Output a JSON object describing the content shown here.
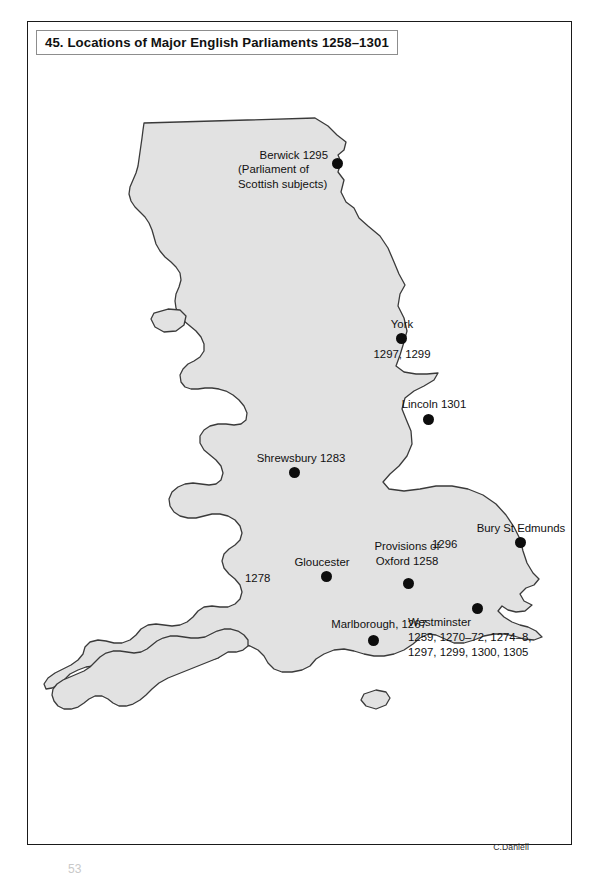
{
  "page": {
    "title_number": "45.",
    "title": "45. Locations of Major English Parliaments 1258–1301",
    "credit": "C.Daniell",
    "folio": "53",
    "background_color": "#ffffff",
    "frame_color": "#1a1a1a",
    "title_box_border_color": "#8d8d8d"
  },
  "map": {
    "name": "england-and-wales-outline",
    "fill_color": "#e2e2e2",
    "stroke_color": "#3a3a3a",
    "marker_color": "#0d0d0d",
    "label_color": "#111111"
  },
  "markers": [
    {
      "id": "berwick",
      "name": "Berwick",
      "lines": [
        "Berwick 1295",
        "(Parliament of",
        "Scottish subjects)"
      ],
      "years": "1295",
      "note": "Parliament of Scottish subjects",
      "dot": {
        "x": 309,
        "y": 141
      },
      "label": {
        "x": 236,
        "y": 134,
        "align": "left"
      }
    },
    {
      "id": "york",
      "name": "York",
      "lines": [
        "York",
        "1297, 1299"
      ],
      "years": "1297, 1299",
      "dot": {
        "x": 379,
        "y": 321
      },
      "label_above": {
        "x": 379,
        "y": 302
      },
      "label_below": {
        "x": 379,
        "y": 330
      }
    },
    {
      "id": "lincoln",
      "name": "Lincoln",
      "lines": [
        "Lincoln 1301"
      ],
      "years": "1301",
      "dot": {
        "x": 406,
        "y": 402
      },
      "label": {
        "x": 406,
        "y": 382
      }
    },
    {
      "id": "shrewsbury",
      "name": "Shrewsbury",
      "lines": [
        "Shrewsbury 1283"
      ],
      "years": "1283",
      "dot": {
        "x": 272,
        "y": 455
      },
      "label": {
        "x": 272,
        "y": 436
      }
    },
    {
      "id": "bury-st-edmunds",
      "name": "Bury St Edmunds",
      "lines": [
        "Bury St Edmunds",
        "1296"
      ],
      "years": "1296",
      "dot": {
        "x": 498,
        "y": 525
      },
      "label_above": {
        "x": 492,
        "y": 506
      },
      "label_years": {
        "x": 449,
        "y": 522
      }
    },
    {
      "id": "gloucester",
      "name": "Gloucester",
      "lines": [
        "Gloucester",
        "1278"
      ],
      "years": "1278",
      "dot": {
        "x": 304,
        "y": 560
      },
      "label_above": {
        "x": 294,
        "y": 540
      },
      "label_years": {
        "x": 262,
        "y": 556
      }
    },
    {
      "id": "provisions-of-oxford",
      "name": "Provisions of Oxford",
      "lines": [
        "Provisions of",
        "Oxford 1258"
      ],
      "years": "1258",
      "dot": {
        "x": 386,
        "y": 566
      },
      "label": {
        "x": 386,
        "y": 524
      }
    },
    {
      "id": "marlborough",
      "name": "Marlborough",
      "lines": [
        "Marlborough, 1267"
      ],
      "years": "1267",
      "dot": {
        "x": 351,
        "y": 623
      },
      "label": {
        "x": 351,
        "y": 602
      }
    },
    {
      "id": "westminster",
      "name": "Westminster",
      "lines": [
        "Westminster",
        "1259, 1270–72, 1274–8,",
        "1297, 1299, 1300, 1305"
      ],
      "years": "1259, 1270–72, 1274–8, 1297, 1299, 1300, 1305",
      "dot": {
        "x": 455,
        "y": 591
      },
      "label": {
        "x": 408,
        "y": 600,
        "align": "left"
      }
    }
  ]
}
